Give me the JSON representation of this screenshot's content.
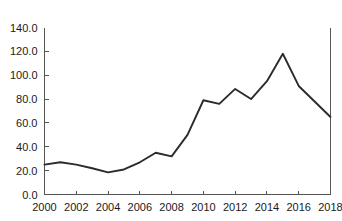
{
  "chart_data": {
    "type": "line",
    "title": "",
    "subtitle": "",
    "xlabel": "",
    "ylabel": "US$ bn",
    "ylabel_displayed": "IS$ bn",
    "xlim": [
      2000,
      2018
    ],
    "ylim": [
      0.0,
      140.0
    ],
    "grid": false,
    "legend": "none",
    "x": [
      2000,
      2001,
      2002,
      2003,
      2004,
      2005,
      2006,
      2007,
      2008,
      2009,
      2010,
      2011,
      2012,
      2013,
      2014,
      2015,
      2016,
      2017,
      2018
    ],
    "series": [
      {
        "name": "value",
        "values": [
          25.0,
          27.0,
          25.0,
          22.0,
          18.5,
          21.0,
          27.0,
          35.0,
          32.0,
          50.0,
          79.0,
          76.0,
          88.5,
          80.0,
          95.0,
          118.0,
          91.0,
          78.0,
          65.0
        ]
      }
    ],
    "yticks": [
      0.0,
      20.0,
      40.0,
      60.0,
      80.0,
      100.0,
      120.0,
      140.0
    ],
    "ytick_labels": [
      "0.0",
      "20.0",
      "40.0",
      "60.0",
      "80.0",
      "100.0",
      "120.0",
      "140.0"
    ],
    "xticks": [
      2000,
      2002,
      2004,
      2006,
      2008,
      2010,
      2012,
      2014,
      2016,
      2018
    ],
    "xtick_labels": [
      "2000",
      "2002",
      "2004",
      "2006",
      "2008",
      "2010",
      "2012",
      "2014",
      "2016",
      "2018"
    ],
    "line_color": "#2b2b2b",
    "axis_color": "#555555",
    "background_color": "#ffffff"
  }
}
